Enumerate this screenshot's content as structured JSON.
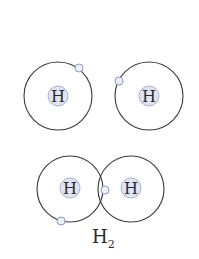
{
  "diagram": {
    "atoms_separate": [
      {
        "symbol": "H",
        "cx": 58,
        "cy": 96,
        "r": 34,
        "electron": {
          "cx": 79,
          "cy": 68
        }
      },
      {
        "symbol": "H",
        "cx": 149,
        "cy": 96,
        "r": 34,
        "electron": {
          "cx": 119,
          "cy": 81
        }
      }
    ],
    "molecule": {
      "atoms": [
        {
          "symbol": "H",
          "cx": 70,
          "cy": 189,
          "r": 33
        },
        {
          "symbol": "H",
          "cx": 131,
          "cy": 189,
          "r": 33
        }
      ],
      "electrons": [
        {
          "cx": 105,
          "cy": 190
        },
        {
          "cx": 61,
          "cy": 221
        }
      ],
      "label_main": "H",
      "label_sub": "2"
    },
    "colors": {
      "orbit": "#3a3a3a",
      "nucleus_fill": "#dfe3f2",
      "electron_stroke": "#8d97c9"
    }
  }
}
